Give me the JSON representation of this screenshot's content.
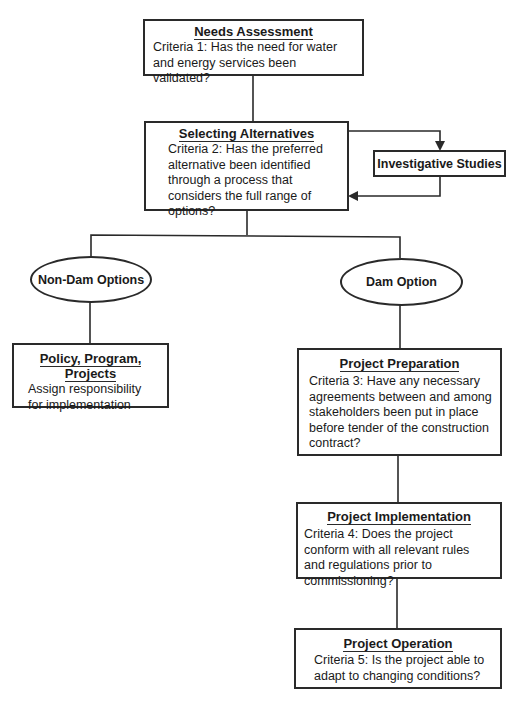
{
  "diagram": {
    "type": "flowchart",
    "nodes": {
      "needs": {
        "title": "Needs Assessment",
        "body": "Criteria 1: Has the need for water and energy services been validated?"
      },
      "selecting": {
        "title": "Selecting Alternatives",
        "body": "Criteria 2: Has the preferred alternative been identified through a process that considers the full range of options?"
      },
      "investigative": {
        "title": "Investigative Studies"
      },
      "non_dam": {
        "title": "Non-Dam Options"
      },
      "dam": {
        "title": "Dam Option"
      },
      "policy": {
        "title": "Policy, Program, Projects",
        "body": "Assign responsibility for implementation"
      },
      "preparation": {
        "title": "Project Preparation",
        "body": "Criteria 3: Have any necessary agreements between and among stakeholders been put in place before tender of the construction contract?"
      },
      "implementation": {
        "title": "Project Implementation",
        "body": "Criteria 4: Does the project conform with all relevant rules and regulations prior to commissioning?"
      },
      "operation": {
        "title": "Project Operation",
        "body": "Criteria 5: Is the project able to adapt to changing conditions?"
      }
    },
    "edges": [
      {
        "from": "needs",
        "to": "selecting"
      },
      {
        "from": "selecting",
        "to": "investigative",
        "arrow": true
      },
      {
        "from": "investigative",
        "to": "selecting",
        "arrow": true
      },
      {
        "from": "selecting",
        "to": "non_dam"
      },
      {
        "from": "selecting",
        "to": "dam"
      },
      {
        "from": "non_dam",
        "to": "policy"
      },
      {
        "from": "dam",
        "to": "preparation"
      },
      {
        "from": "preparation",
        "to": "implementation"
      },
      {
        "from": "implementation",
        "to": "operation"
      }
    ],
    "colors": {
      "line": "#2a2a2a",
      "background": "#ffffff"
    }
  }
}
